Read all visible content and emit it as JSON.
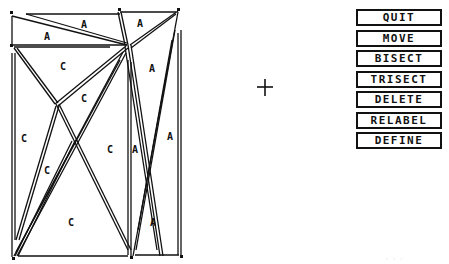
{
  "menu": {
    "items": [
      {
        "label": "QUIT"
      },
      {
        "label": "MOVE"
      },
      {
        "label": "BISECT"
      },
      {
        "label": "TRISECT"
      },
      {
        "label": "DELETE"
      },
      {
        "label": "RELABEL"
      },
      {
        "label": "DEFINE"
      }
    ]
  },
  "canvas": {
    "cursor": "crosshair-plus",
    "labels": [
      {
        "text": "A",
        "x": 84,
        "y": 28
      },
      {
        "text": "A",
        "x": 47,
        "y": 40
      },
      {
        "text": "A",
        "x": 140,
        "y": 27
      },
      {
        "text": "C",
        "x": 63,
        "y": 70
      },
      {
        "text": "C",
        "x": 84,
        "y": 102
      },
      {
        "text": "A",
        "x": 152,
        "y": 72
      },
      {
        "text": "C",
        "x": 24,
        "y": 142
      },
      {
        "text": "C",
        "x": 110,
        "y": 153
      },
      {
        "text": "A",
        "x": 135,
        "y": 153
      },
      {
        "text": "A",
        "x": 170,
        "y": 140
      },
      {
        "text": "C",
        "x": 47,
        "y": 174
      },
      {
        "text": "C",
        "x": 71,
        "y": 226
      },
      {
        "text": "A",
        "x": 153,
        "y": 226
      }
    ]
  },
  "footer": {
    "text": "· · ·"
  }
}
